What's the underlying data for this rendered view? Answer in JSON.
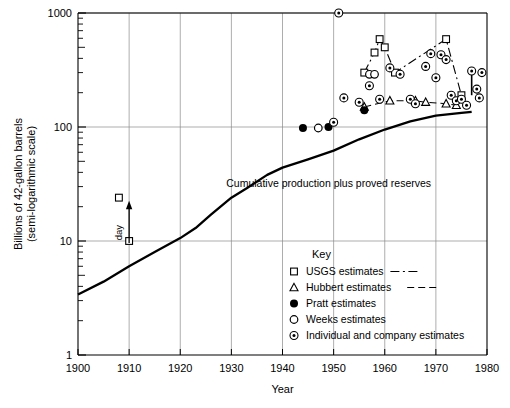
{
  "chart_data": {
    "type": "scatter",
    "title": "",
    "xlabel": "Year",
    "ylabel": "Billions of 42-gallon barrels (semi-logarithmic scale)",
    "ylabel_line1": "Billions of 42-gallon barrels",
    "ylabel_line2": "(semi-logarithmic scale)",
    "xlim": [
      1900,
      1980
    ],
    "ylim": [
      1,
      1000
    ],
    "yscale": "log",
    "grid": true,
    "xticks": [
      1900,
      1910,
      1920,
      1930,
      1940,
      1950,
      1960,
      1970,
      1980
    ],
    "xtick_labels": [
      "1900",
      "1910",
      "1920",
      "1930",
      "1940",
      "1950",
      "1960",
      "1970",
      "1980"
    ],
    "yticks": [
      1,
      10,
      100,
      1000
    ],
    "ytick_labels": [
      "1",
      "10",
      "100",
      "1000"
    ],
    "legend_position": "lower-center-right",
    "legend_title": "Key",
    "annotations": [
      {
        "name": "curve-label",
        "text": "Cumulative production plus proved reserves",
        "x": 1929,
        "y": 30
      },
      {
        "name": "day-label",
        "text": "day",
        "x": 1910,
        "y": 13
      }
    ],
    "series": [
      {
        "name": "Cumulative production plus proved reserves",
        "marker": "none",
        "linestyle": "solid",
        "color": "#000000",
        "points": [
          [
            1900,
            3.4
          ],
          [
            1905,
            4.4
          ],
          [
            1910,
            6.0
          ],
          [
            1915,
            8.0
          ],
          [
            1920,
            10.6
          ],
          [
            1923,
            13.0
          ],
          [
            1926,
            17.0
          ],
          [
            1930,
            24.0
          ],
          [
            1933,
            29.0
          ],
          [
            1937,
            38.0
          ],
          [
            1940,
            44.0
          ],
          [
            1945,
            52.0
          ],
          [
            1950,
            62.0
          ],
          [
            1955,
            78.0
          ],
          [
            1960,
            95.0
          ],
          [
            1965,
            112.0
          ],
          [
            1970,
            126.0
          ],
          [
            1975,
            133.0
          ],
          [
            1977,
            136.0
          ]
        ]
      },
      {
        "name": "USGS estimates",
        "marker": "open-square",
        "linestyle": "dashdot",
        "color": "#000000",
        "points": [
          [
            1908,
            24.0
          ],
          [
            1910,
            10.0
          ],
          [
            1956,
            300.0
          ],
          [
            1958,
            450.0
          ],
          [
            1959,
            590.0
          ],
          [
            1960,
            500.0
          ],
          [
            1962,
            300.0
          ],
          [
            1972,
            590.0
          ],
          [
            1975,
            190.0
          ]
        ],
        "connected_points": [
          [
            1956,
            300.0
          ],
          [
            1958,
            450.0
          ],
          [
            1959,
            590.0
          ],
          [
            1960,
            500.0
          ],
          [
            1962,
            300.0
          ],
          [
            1972,
            590.0
          ],
          [
            1975,
            190.0
          ]
        ]
      },
      {
        "name": "Hubbert estimates",
        "marker": "open-triangle",
        "linestyle": "dashed",
        "color": "#000000",
        "points": [
          [
            1956,
            150.0
          ],
          [
            1961,
            170.0
          ],
          [
            1966,
            170.0
          ],
          [
            1968,
            165.0
          ],
          [
            1972,
            160.0
          ],
          [
            1974,
            155.0
          ]
        ]
      },
      {
        "name": "Pratt estimates",
        "marker": "filled-circle",
        "linestyle": "none",
        "color": "#000000",
        "points": [
          [
            1944,
            98.0
          ],
          [
            1949,
            100.0
          ],
          [
            1956,
            140.0
          ]
        ]
      },
      {
        "name": "Weeks estimates",
        "marker": "open-circle",
        "linestyle": "none",
        "color": "#000000",
        "points": [
          [
            1947,
            98.0
          ],
          [
            1957,
            290.0
          ],
          [
            1958,
            290.0
          ]
        ]
      },
      {
        "name": "Individual and company estimates",
        "marker": "circle-dot",
        "linestyle": "none",
        "color": "#000000",
        "points": [
          [
            1951,
            1000.0
          ],
          [
            1950,
            110.0
          ],
          [
            1952,
            180.0
          ],
          [
            1955,
            165.0
          ],
          [
            1957,
            230.0
          ],
          [
            1959,
            175.0
          ],
          [
            1961,
            330.0
          ],
          [
            1963,
            290.0
          ],
          [
            1965,
            175.0
          ],
          [
            1966,
            160.0
          ],
          [
            1968,
            340.0
          ],
          [
            1969,
            440.0
          ],
          [
            1970,
            270.0
          ],
          [
            1971,
            430.0
          ],
          [
            1972,
            390.0
          ],
          [
            1973,
            190.0
          ],
          [
            1974,
            170.0
          ],
          [
            1975,
            175.0
          ],
          [
            1976,
            155.0
          ],
          [
            1977,
            310.0
          ],
          [
            1978,
            215.0
          ],
          [
            1978.5,
            180.0
          ],
          [
            1979,
            300.0
          ]
        ],
        "connected_pairs": [
          [
            [
              1977,
              310.0
            ],
            [
              1977,
              190.0
            ]
          ]
        ]
      }
    ],
    "legend_entries": [
      {
        "label": "USGS estimates",
        "marker": "open-square",
        "linestyle": "dashdot"
      },
      {
        "label": "Hubbert estimates",
        "marker": "open-triangle",
        "linestyle": "dashed"
      },
      {
        "label": "Pratt estimates",
        "marker": "filled-circle",
        "linestyle": "none"
      },
      {
        "label": "Weeks estimates",
        "marker": "open-circle",
        "linestyle": "none"
      },
      {
        "label": "Individual and company estimates",
        "marker": "circle-dot",
        "linestyle": "none"
      }
    ]
  }
}
